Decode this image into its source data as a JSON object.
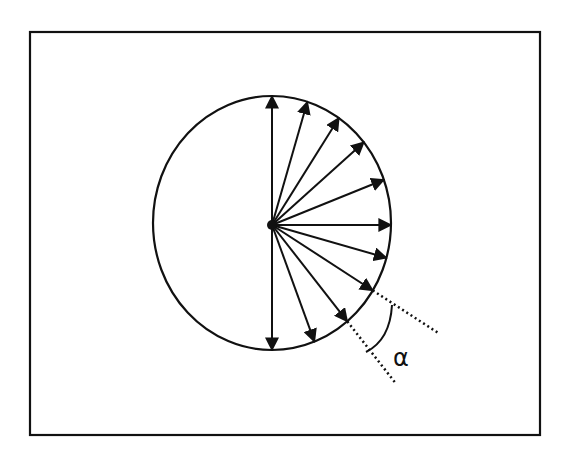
{
  "figure": {
    "angle_label": "α",
    "vector_count": 11,
    "vector_angles_deg": [
      90,
      74,
      58,
      42,
      22,
      0,
      -16,
      -33,
      -52,
      -70,
      -90
    ],
    "alpha_between_deg": [
      -33,
      -52
    ]
  },
  "bleed_text": [
    "iguous ground. In order to ... mechanics,",
    "moments, in which the property known ...",
    "scale, we will use the ... ",
    "Comparing this with the sweep method we",
    "see in the ... used the first square",
    "... weighted ... ",
    "... ",
    "... the ... ",
    "... ",
    "... ",
    "... and ... ",
    "number of ... "
  ],
  "colors": {
    "ink": "#111111",
    "paper": "#ffffff"
  }
}
